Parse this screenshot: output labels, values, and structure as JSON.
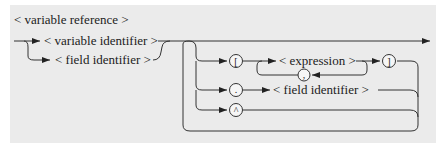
{
  "diagram": {
    "title": "< variable reference >",
    "entry_options": [
      {
        "label": "< variable identifier >"
      },
      {
        "label": "< field identifier >"
      }
    ],
    "selectors": [
      {
        "symbol": "[",
        "name": "left-bracket"
      },
      {
        "symbol": "]",
        "name": "right-bracket"
      },
      {
        "symbol": ",",
        "name": "comma"
      },
      {
        "symbol": ".",
        "name": "period"
      },
      {
        "symbol": "^",
        "name": "caret"
      }
    ],
    "expression_label": "< expression >",
    "field_label": "< field identifier >",
    "colors": {
      "panel": "#ebebeb",
      "line": "#333333"
    }
  }
}
